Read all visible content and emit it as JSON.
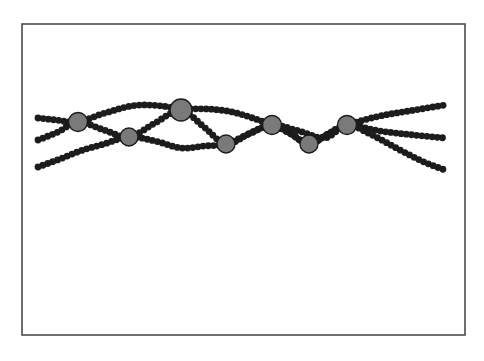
{
  "figure": {
    "background_color": "#ffffff",
    "frame": {
      "name": "figure-border",
      "x": 22,
      "y": 24,
      "width": 443,
      "height": 311,
      "stroke_color": "#4a4a4a",
      "stroke_width": 1.6,
      "fill_color": "#ffffff"
    },
    "bead": {
      "color": "#1c1c1c",
      "radius": 3.4,
      "spacing": 5.2,
      "count_total": 330
    },
    "node": {
      "fill_color": "#7a7a7a",
      "stroke_color": "#1c1c1c",
      "stroke_width": 1.4,
      "count": 7
    }
  },
  "chart_data": {
    "type": "line",
    "subtitle": "",
    "xlabel": "",
    "ylabel": "",
    "xlim": [
      22,
      465
    ],
    "ylim": [
      24,
      335
    ],
    "grid": false,
    "legend_position": "none",
    "annotations": [],
    "tick_labels_x": [],
    "tick_labels_y": [],
    "series": [
      {
        "name": "strand-1",
        "color": "#1c1c1c",
        "marker": "bead-circle",
        "points": [
          [
            38,
            118
          ],
          [
            56,
            120
          ],
          [
            78,
            122
          ],
          [
            105,
            113
          ],
          [
            140,
            105
          ],
          [
            181,
            110
          ],
          [
            204,
            127
          ],
          [
            226,
            144
          ],
          [
            250,
            133
          ],
          [
            272,
            125
          ],
          [
            291,
            134
          ],
          [
            309,
            144
          ],
          [
            328,
            134
          ],
          [
            347,
            125
          ],
          [
            380,
            116
          ],
          [
            415,
            110
          ],
          [
            445,
            105
          ]
        ]
      },
      {
        "name": "strand-2",
        "color": "#1c1c1c",
        "marker": "bead-circle",
        "points": [
          [
            38,
            140
          ],
          [
            58,
            132
          ],
          [
            78,
            122
          ],
          [
            104,
            130
          ],
          [
            129,
            137
          ],
          [
            155,
            123
          ],
          [
            181,
            110
          ],
          [
            227,
            111
          ],
          [
            272,
            125
          ],
          [
            291,
            134
          ],
          [
            309,
            144
          ],
          [
            328,
            134
          ],
          [
            347,
            125
          ],
          [
            380,
            131
          ],
          [
            414,
            135
          ],
          [
            445,
            138
          ]
        ]
      },
      {
        "name": "strand-3",
        "color": "#1c1c1c",
        "marker": "bead-circle",
        "points": [
          [
            38,
            167
          ],
          [
            60,
            159
          ],
          [
            80,
            151
          ],
          [
            104,
            144
          ],
          [
            129,
            137
          ],
          [
            155,
            141
          ],
          [
            181,
            148
          ],
          [
            204,
            146
          ],
          [
            226,
            144
          ],
          [
            249,
            134
          ],
          [
            272,
            125
          ],
          [
            299,
            131
          ],
          [
            325,
            138
          ],
          [
            347,
            125
          ],
          [
            370,
            134
          ],
          [
            400,
            150
          ],
          [
            424,
            162
          ],
          [
            445,
            170
          ]
        ]
      }
    ],
    "nodes": [
      {
        "name": "crossing-node-1",
        "x": 78,
        "y": 122,
        "radius": 9.5
      },
      {
        "name": "crossing-node-2",
        "x": 129,
        "y": 137,
        "radius": 9.0
      },
      {
        "name": "crossing-node-3",
        "x": 181,
        "y": 110,
        "radius": 11.0
      },
      {
        "name": "crossing-node-4",
        "x": 226,
        "y": 144,
        "radius": 9.0
      },
      {
        "name": "crossing-node-5",
        "x": 272,
        "y": 125,
        "radius": 9.5
      },
      {
        "name": "crossing-node-6",
        "x": 309,
        "y": 144,
        "radius": 9.0
      },
      {
        "name": "crossing-node-7",
        "x": 347,
        "y": 125,
        "radius": 9.5
      }
    ]
  }
}
